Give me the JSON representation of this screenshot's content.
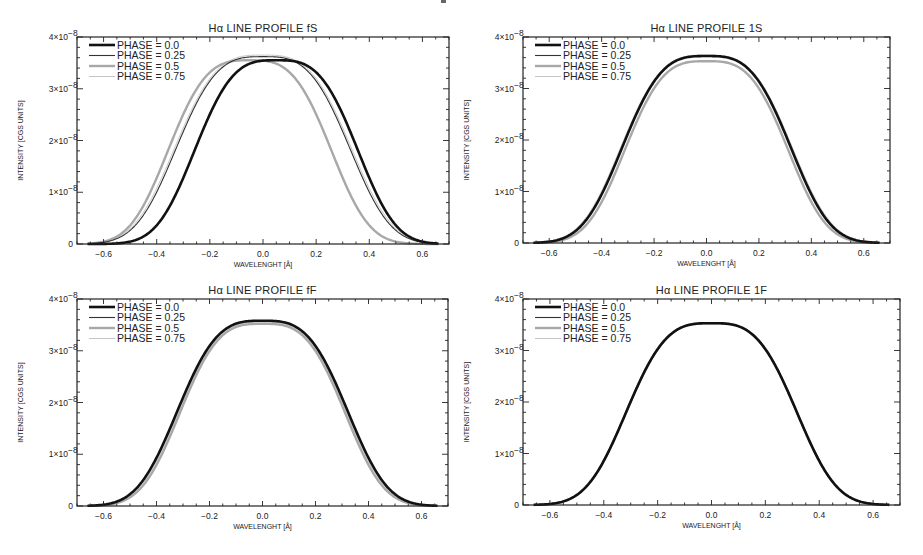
{
  "chart_data": [
    {
      "type": "line",
      "title": "Hα LINE PROFILE fS",
      "xlabel": "WAVELENGHT [Å]",
      "ylabel": "INTENSITY [CGS UNITS]",
      "xlim": [
        -0.7,
        0.7
      ],
      "ylim": [
        0,
        4e-08
      ],
      "xticks": [
        -0.6,
        -0.4,
        -0.2,
        0.0,
        0.2,
        0.4,
        0.6
      ],
      "xtick_labels": [
        "-0.6",
        "-0.4",
        "-0.2",
        "0.0",
        "0.2",
        "0.4",
        "0.6"
      ],
      "yticks": [
        0,
        1e-08,
        2e-08,
        3e-08,
        4e-08
      ],
      "ytick_labels": [
        "0",
        "1×10⁻⁸",
        "2×10⁻⁸",
        "3×10⁻⁸",
        "4×10⁻⁸"
      ],
      "grid": false,
      "legend_position": "upper left",
      "series": [
        {
          "name": "PHASE = 0.0",
          "style": "thick-black",
          "shift": 0.05,
          "peak": 3.55e-08,
          "halfwidth": 0.31
        },
        {
          "name": "PHASE = 0.25",
          "style": "thin-dark",
          "shift": 0.0,
          "peak": 3.62e-08,
          "halfwidth": 0.33
        },
        {
          "name": "PHASE = 0.5",
          "style": "thick-gray",
          "shift": -0.05,
          "peak": 3.55e-08,
          "halfwidth": 0.31
        },
        {
          "name": "PHASE = 0.75",
          "style": "thin-light",
          "shift": 0.0,
          "peak": 3.65e-08,
          "halfwidth": 0.335
        }
      ]
    },
    {
      "type": "line",
      "title": "Hα LINE PROFILE 1S",
      "xlabel": "WAVELENGHT [Å]",
      "ylabel": "INTENSITY [CGS UNITS]",
      "xlim": [
        -0.7,
        0.7
      ],
      "ylim": [
        0,
        4e-08
      ],
      "xticks": [
        -0.6,
        -0.4,
        -0.2,
        0.0,
        0.2,
        0.4,
        0.6
      ],
      "xtick_labels": [
        "-0.6",
        "-0.4",
        "-0.2",
        "0.0",
        "0.2",
        "0.4",
        "0.6"
      ],
      "yticks": [
        0,
        1e-08,
        2e-08,
        3e-08,
        4e-08
      ],
      "ytick_labels": [
        "0",
        "1×10⁻⁸",
        "2×10⁻⁸",
        "3×10⁻⁸",
        "4×10⁻⁸"
      ],
      "grid": false,
      "legend_position": "upper left",
      "series": [
        {
          "name": "PHASE = 0.0",
          "style": "thick-black",
          "shift": 0.0,
          "peak": 3.63e-08,
          "halfwidth": 0.325
        },
        {
          "name": "PHASE = 0.25",
          "style": "thin-dark",
          "shift": 0.0,
          "peak": 3.63e-08,
          "halfwidth": 0.325
        },
        {
          "name": "PHASE = 0.5",
          "style": "thick-gray",
          "shift": 0.0,
          "peak": 3.53e-08,
          "halfwidth": 0.315
        },
        {
          "name": "PHASE = 0.75",
          "style": "thin-light",
          "shift": 0.0,
          "peak": 3.65e-08,
          "halfwidth": 0.33
        }
      ]
    },
    {
      "type": "line",
      "title": "Hα LINE PROFILE fF",
      "xlabel": "WAVELENGHT [Å]",
      "ylabel": "INTENSITY [CGS UNITS]",
      "xlim": [
        -0.7,
        0.7
      ],
      "ylim": [
        0,
        4e-08
      ],
      "xticks": [
        -0.6,
        -0.4,
        -0.2,
        0.0,
        0.2,
        0.4,
        0.6
      ],
      "xtick_labels": [
        "-0.6",
        "-0.4",
        "-0.2",
        "0.0",
        "0.2",
        "0.4",
        "0.6"
      ],
      "yticks": [
        0,
        1e-08,
        2e-08,
        3e-08,
        4e-08
      ],
      "ytick_labels": [
        "0",
        "1×10⁻⁸",
        "2×10⁻⁸",
        "3×10⁻⁸",
        "4×10⁻⁸"
      ],
      "grid": false,
      "legend_position": "upper left",
      "series": [
        {
          "name": "PHASE = 0.0",
          "style": "thick-black",
          "shift": 0.0,
          "peak": 3.58e-08,
          "halfwidth": 0.325
        },
        {
          "name": "PHASE = 0.25",
          "style": "thin-dark",
          "shift": 0.0,
          "peak": 3.58e-08,
          "halfwidth": 0.325
        },
        {
          "name": "PHASE = 0.5",
          "style": "thick-gray",
          "shift": 0.0,
          "peak": 3.52e-08,
          "halfwidth": 0.315
        },
        {
          "name": "PHASE = 0.75",
          "style": "thin-light",
          "shift": 0.0,
          "peak": 3.55e-08,
          "halfwidth": 0.32
        }
      ]
    },
    {
      "type": "line",
      "title": "Hα LINE PROFILE 1F",
      "xlabel": "WAVELENGHT [Å]",
      "ylabel": "INTENSITY [CGS UNITS]",
      "xlim": [
        -0.7,
        0.7
      ],
      "ylim": [
        0,
        4e-08
      ],
      "xticks": [
        -0.6,
        -0.4,
        -0.2,
        0.0,
        0.2,
        0.4,
        0.6
      ],
      "xtick_labels": [
        "-0.6",
        "-0.4",
        "-0.2",
        "0.0",
        "0.2",
        "0.4",
        "0.6"
      ],
      "yticks": [
        0,
        1e-08,
        2e-08,
        3e-08,
        4e-08
      ],
      "ytick_labels": [
        "0",
        "1×10⁻⁸",
        "2×10⁻⁸",
        "3×10⁻⁸",
        "4×10⁻⁸"
      ],
      "grid": false,
      "legend_position": "upper left",
      "series": [
        {
          "name": "PHASE = 0.0",
          "style": "thick-black",
          "shift": 0.0,
          "peak": 3.53e-08,
          "halfwidth": 0.32
        },
        {
          "name": "PHASE = 0.25",
          "style": "thin-dark",
          "shift": 0.0,
          "peak": 3.53e-08,
          "halfwidth": 0.32
        },
        {
          "name": "PHASE = 0.5",
          "style": "thick-gray",
          "shift": 0.0,
          "peak": 3.53e-08,
          "halfwidth": 0.32
        },
        {
          "name": "PHASE = 0.75",
          "style": "thin-light",
          "shift": 0.0,
          "peak": 3.53e-08,
          "halfwidth": 0.32
        }
      ]
    }
  ],
  "line_styles": {
    "thick-black": {
      "color": "#111111",
      "width": 2.6
    },
    "thin-dark": {
      "color": "#333333",
      "width": 1.1
    },
    "thick-gray": {
      "color": "#a8a8a8",
      "width": 2.4
    },
    "thin-light": {
      "color": "#c4c4c4",
      "width": 1.0
    }
  },
  "panels_layout": [
    {
      "frame": {
        "x": 77,
        "y": 37,
        "w": 372,
        "h": 207
      }
    },
    {
      "frame": {
        "x": 523,
        "y": 37,
        "w": 367,
        "h": 206
      }
    },
    {
      "frame": {
        "x": 77,
        "y": 299,
        "w": 371,
        "h": 207
      }
    },
    {
      "frame": {
        "x": 523,
        "y": 299,
        "w": 377,
        "h": 206
      }
    }
  ]
}
